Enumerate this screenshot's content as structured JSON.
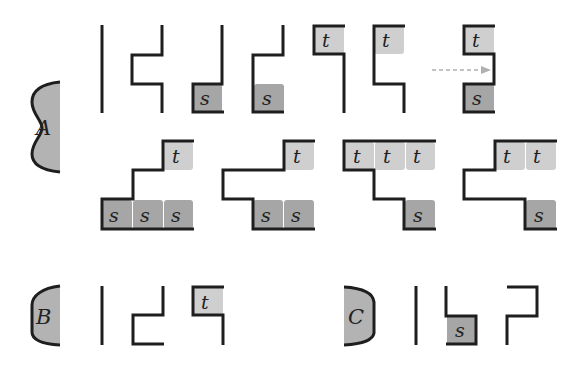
{
  "figure": {
    "regions": [
      {
        "id": "A",
        "label": "A"
      },
      {
        "id": "B",
        "label": "B"
      },
      {
        "id": "C",
        "label": "C"
      }
    ],
    "cells": {
      "s": "s",
      "t": "t"
    },
    "colors": {
      "line": "#1e1e1e",
      "s_fill": "#a6a6a6",
      "t_fill": "#cfcfcf",
      "region_fill": "#b3b3b3",
      "arrow": "#b0b0b0"
    }
  }
}
